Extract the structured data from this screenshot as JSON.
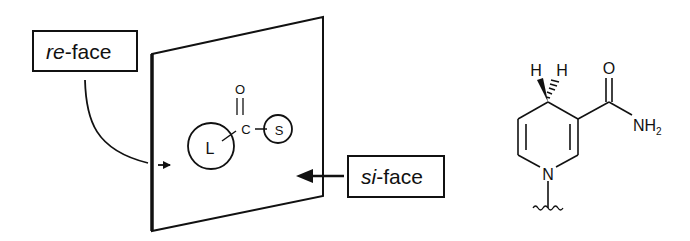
{
  "labels": {
    "re_face": {
      "italic": "re",
      "rest": "-face"
    },
    "si_face": {
      "italic": "si",
      "rest": "-face"
    }
  },
  "substrate": {
    "carbonyl_oxygen": "O",
    "carbonyl_carbon": "C",
    "large_group": "L",
    "small_group": "S"
  },
  "cofactor": {
    "name": "NADH nicotinamide (1,4-dihydropyridine)",
    "h_left": "H",
    "h_right": "H",
    "amide_oxygen": "O",
    "amide_n": "NH",
    "amide_n_subscript": "2",
    "ring_nitrogen": "N"
  },
  "colors": {
    "ink": "#111111",
    "background": "#ffffff"
  }
}
